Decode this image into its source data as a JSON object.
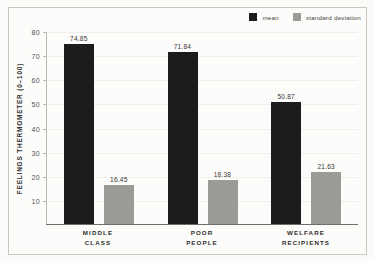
{
  "chart_data": {
    "type": "bar",
    "title": "",
    "subtitle": "",
    "xlabel": "",
    "ylabel": "FEELINGS THERMOMETER (0–100)",
    "categories": [
      "MIDDLE CLASS",
      "POOR PEOPLE",
      "WELFARE RECIPIENTS"
    ],
    "category_lines": [
      [
        "MIDDLE",
        "CLASS"
      ],
      [
        "POOR",
        "PEOPLE"
      ],
      [
        "WELFARE",
        "RECIPIENTS"
      ]
    ],
    "series": [
      {
        "name": "mean",
        "color": "#1c1c1c",
        "values": [
          74.85,
          71.84,
          50.87
        ],
        "labels": [
          "74.85",
          "71.84",
          "50.87"
        ]
      },
      {
        "name": "standard deviation",
        "color": "#9b9a96",
        "values": [
          16.45,
          18.38,
          21.63
        ],
        "labels": [
          "16.45",
          "18.38",
          "21.63"
        ]
      }
    ],
    "ylim": [
      0,
      80
    ],
    "yticks": [
      10,
      20,
      30,
      40,
      50,
      60,
      70,
      80
    ],
    "ytick_labels": [
      "10",
      "20",
      "30",
      "40",
      "50",
      "60",
      "70",
      "80"
    ],
    "grid": true,
    "legend_position": "top-right"
  },
  "legend": {
    "entries": [
      {
        "label": "mean",
        "color": "#1c1c1c"
      },
      {
        "label": "standard deviation",
        "color": "#9b9a96"
      }
    ]
  },
  "colors": {
    "mean": "#1c1c1c",
    "standard_deviation": "#9b9a96",
    "frame": "#c9c7c2",
    "gridline": "#efeeea",
    "axis": "#6f6d68",
    "background": "#fcfcfb"
  }
}
